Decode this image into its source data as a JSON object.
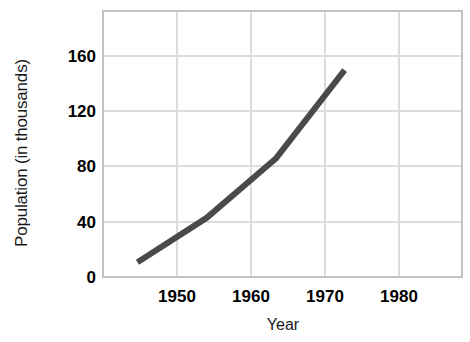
{
  "chart_data": {
    "type": "line",
    "title": "",
    "xlabel": "Year",
    "ylabel": "Population (in thousands)",
    "x": [
      1950,
      1960,
      1970,
      1980
    ],
    "xticklabels": [
      "1950",
      "1960",
      "1970",
      "1980"
    ],
    "values": [
      10,
      40,
      80,
      140
    ],
    "yticks": [
      0,
      40,
      80,
      120,
      160
    ],
    "yticklabels": [
      "0",
      "40",
      "80",
      "120",
      "160"
    ],
    "ylim": [
      0,
      180
    ],
    "xlim": [
      1945,
      1997
    ],
    "grid": true,
    "legend": null,
    "series": [
      {
        "name": "Population",
        "values": [
          10,
          40,
          80,
          140
        ]
      }
    ],
    "colors": {
      "line": "#4a4a4a",
      "grid": "#d9d9d9",
      "axis": "#bfbfbf",
      "background": "#ffffff",
      "text": "#000000"
    },
    "line_width_px": 6
  },
  "axis": {
    "y_title": "Population (in thousands)",
    "x_title": "Year"
  }
}
